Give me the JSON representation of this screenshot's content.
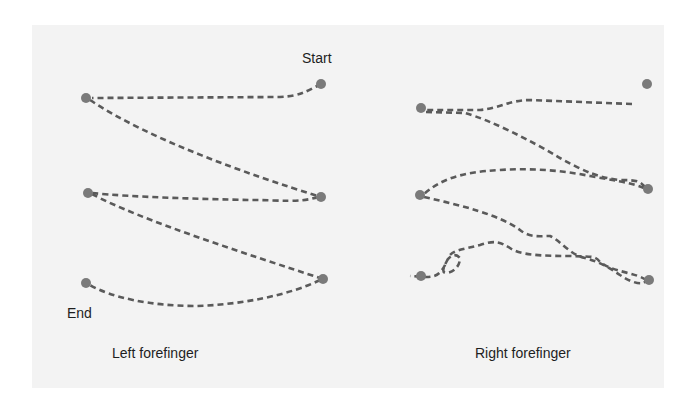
{
  "labels": {
    "start": "Start",
    "end": "End"
  },
  "captions": {
    "left": "Left forefinger",
    "right": "Right forefinger"
  },
  "colors": {
    "background": "#ffffff",
    "panel": "#f3f3f3",
    "dot": "#7a7a7a",
    "dash": "#5a5a5a",
    "text": "#1e1e1e"
  },
  "diagrams": [
    {
      "name": "Left forefinger",
      "points": [
        {
          "id": "start",
          "x": 321,
          "y": 84
        },
        {
          "id": "p1",
          "x": 86,
          "y": 98
        },
        {
          "id": "p2",
          "x": 321,
          "y": 197
        },
        {
          "id": "p3",
          "x": 88,
          "y": 193
        },
        {
          "id": "p4",
          "x": 323,
          "y": 279
        },
        {
          "id": "end",
          "x": 86,
          "y": 283
        }
      ],
      "path_order": [
        "start",
        "p1",
        "p2",
        "p3",
        "p4",
        "end"
      ]
    },
    {
      "name": "Right forefinger",
      "points": [
        {
          "id": "start",
          "x": 647,
          "y": 84
        },
        {
          "id": "p1",
          "x": 421,
          "y": 108
        },
        {
          "id": "p2",
          "x": 648,
          "y": 189
        },
        {
          "id": "p3",
          "x": 420,
          "y": 195
        },
        {
          "id": "p4",
          "x": 649,
          "y": 280
        },
        {
          "id": "end",
          "x": 421,
          "y": 276
        }
      ],
      "path_order": [
        "start",
        "p1",
        "p2",
        "p3",
        "p4",
        "end"
      ]
    }
  ]
}
